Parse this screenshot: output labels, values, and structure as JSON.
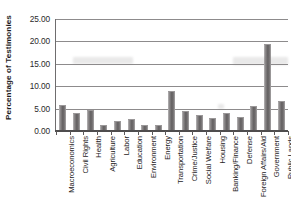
{
  "chart_data": {
    "type": "bar",
    "title": "",
    "xlabel": "",
    "ylabel": "Percentage of Testimonies",
    "ylim": [
      0,
      25
    ],
    "ytick_labels": [
      "0.00",
      "5.00",
      "10.00",
      "15.00",
      "20.00",
      "25.00"
    ],
    "ytick_values": [
      0,
      5,
      10,
      15,
      20,
      25
    ],
    "grid": true,
    "legend": "none",
    "categories": [
      "Macroeconomics",
      "Civil Rights",
      "Health",
      "Agriculture",
      "Labor",
      "Education",
      "Environment",
      "Energy",
      "Transportation",
      "Crime/Justice",
      "Social Welfare",
      "Housing",
      "Banking/Finance",
      "Defense",
      "Foreign Affairs/Aid",
      "Government",
      "Public Lands"
    ],
    "values": [
      5.3,
      3.6,
      4.3,
      0.8,
      1.7,
      2.2,
      0.8,
      0.8,
      8.5,
      4.0,
      3.2,
      2.4,
      3.5,
      2.7,
      5.2,
      19.2,
      6.3
    ],
    "bar_color": "#6f6c6d",
    "gridline_color": "#8d8b8c",
    "axis_color": "#4f4d4e",
    "background_color": "#ffffff"
  }
}
